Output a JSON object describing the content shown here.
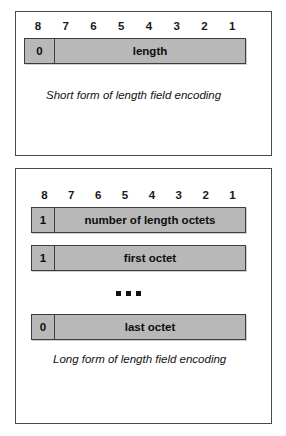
{
  "figure": {
    "bit_labels": [
      "8",
      "7",
      "6",
      "5",
      "4",
      "3",
      "2",
      "1"
    ],
    "fill_color": "#b8b8b8",
    "border_color": "#3d3d3d",
    "ellipsis_symbol": "■ ■ ■"
  },
  "short_form": {
    "caption": "Short form of length field encoding",
    "bars": [
      {
        "flag": "0",
        "label": "length"
      }
    ]
  },
  "long_form": {
    "caption": "Long form of length field encoding",
    "bars": [
      {
        "flag": "1",
        "label": "number of length octets"
      },
      {
        "flag": "1",
        "label": "first octet"
      },
      {
        "flag": "0",
        "label": "last octet"
      }
    ]
  }
}
